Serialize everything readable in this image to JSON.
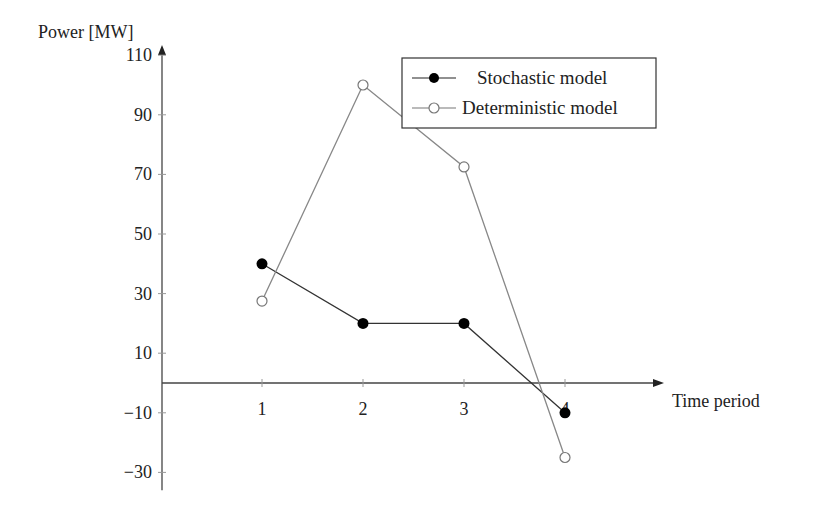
{
  "chart_data": {
    "type": "line",
    "title": "",
    "xlabel": "Time period",
    "ylabel": "Power [MW]",
    "x": [
      1,
      2,
      3,
      4
    ],
    "xticks": [
      "1",
      "2",
      "3",
      "4"
    ],
    "yticks": [
      110,
      90,
      70,
      50,
      30,
      10,
      -10,
      -30
    ],
    "ytick_labels": [
      "110",
      "90",
      "70",
      "50",
      "30",
      "10",
      "−10",
      "−30"
    ],
    "xlim": [
      0,
      5
    ],
    "ylim": [
      -34,
      112
    ],
    "grid": false,
    "legend_position": "top-right",
    "series": [
      {
        "name": "Stochastic model",
        "marker": "filled-circle",
        "color": "#000000",
        "values": [
          40,
          20,
          20,
          -10
        ]
      },
      {
        "name": "Deterministic model",
        "marker": "open-circle",
        "color": "#777777",
        "values": [
          27.5,
          100,
          72.5,
          -25
        ]
      }
    ]
  }
}
